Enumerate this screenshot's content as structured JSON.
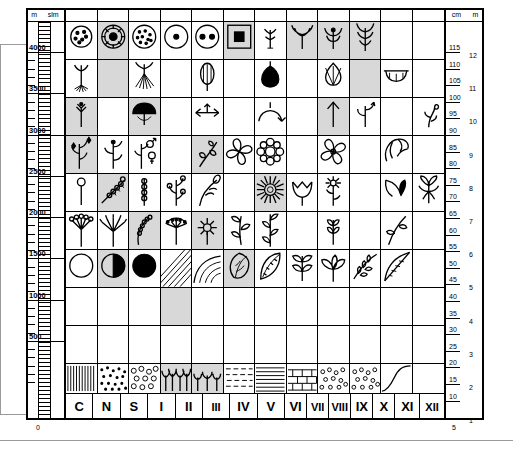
{
  "figure": {
    "type": "pollen-diagram-symbol-key",
    "left_axis": {
      "header_units": [
        "m",
        "slm"
      ],
      "labels": [
        "4000",
        "3500",
        "3000",
        "2500",
        "2000",
        "1500",
        "1000",
        "500",
        "0"
      ],
      "range": [
        0,
        4000
      ]
    },
    "right_axis": {
      "header_units": [
        "cm",
        "m"
      ],
      "cm_labels": [
        "115",
        "110",
        "105",
        "100",
        "95",
        "90",
        "85",
        "80",
        "75",
        "70",
        "65",
        "60",
        "55",
        "50",
        "45",
        "40",
        "35",
        "30",
        "25",
        "20",
        "15",
        "10"
      ],
      "m_labels": [
        "12",
        "11",
        "10",
        "9",
        "8",
        "7",
        "6",
        "5",
        "4",
        "3",
        "2",
        "1"
      ]
    },
    "columns": [
      "C",
      "N",
      "S",
      "I",
      "II",
      "III",
      "IV",
      "V",
      "VI",
      "VII",
      "VIII",
      "IX",
      "X",
      "XI",
      "XII"
    ],
    "column_labels_row": [
      "C",
      "N",
      "S",
      "I",
      "II",
      "III",
      "IV",
      "V",
      "VI",
      "VII",
      "VIII",
      "IX",
      "X",
      "XI",
      "XII"
    ],
    "rows": [
      {
        "row": 1,
        "symbols": [
          "pollen-grain-dotted",
          "pollen-grain-concentric-star",
          "pollen-grain-stippled",
          "pollen-grain-single-pore",
          "pollen-grain-two-pores",
          "square-in-square",
          "small-seedling",
          "grass-tuft",
          "plant-sprout-leaves",
          "tall-grass-plant"
        ]
      },
      {
        "row": 2,
        "symbols": [
          "rooted-seedling",
          "fibrous-root-plant",
          "seed-ovoid-striped",
          "bulb-dark",
          "seed-teardrop",
          "boat-shaped-vessel"
        ]
      },
      {
        "row": 3,
        "symbols": [
          "small-flower-stalk",
          "mushroom-cap",
          "double-arrow-spike",
          "curved-arrow-arc",
          "upward-arrow",
          "arrow-branching",
          "curled-tendril"
        ]
      },
      {
        "row": 4,
        "symbols": [
          "flowering-stem",
          "flowering-stem-2",
          "male-female-symbols-plant",
          "leafy-spiral-branch",
          "four-petal-flower",
          "ring-of-petals-flower",
          "broad-petal-flower",
          "curved-petal-flower"
        ]
      },
      {
        "row": 5,
        "symbols": [
          "pin-head-stem",
          "beaded-branch",
          "beaded-stem-vertical",
          "budding-branch",
          "curved-seed-stalk",
          "sunflower-composite",
          "tulip-flower",
          "small-daisy-plant",
          "curved-leaf-pair",
          "iris-flower"
        ]
      },
      {
        "row": 6,
        "symbols": [
          "umbel-multi-head",
          "umbel-spread",
          "catkin-coil",
          "umbel-flat-top",
          "small-composite-flower",
          "leafy-stem",
          "leafy-stem-tall",
          "small-branch-leaves",
          "long-leaf-stem"
        ]
      },
      {
        "row": 7,
        "symbols": [
          "circle-open",
          "circle-half-filled",
          "circle-filled",
          "hatched-square",
          "crescent-shading",
          "broad-leaf",
          "serrated-leaf",
          "compound-leaf",
          "palmate-leaf",
          "feathered-leaf",
          "pointed-leaf-hatched"
        ]
      },
      {
        "row": 8,
        "symbols": [
          "vertical-hatch-texture",
          "dotted-texture",
          "circles-texture",
          "small-plants-row",
          "seedlings-row",
          "dashes-texture",
          "horizontal-lines-texture",
          "brick-texture",
          "gravel-dots-texture",
          "rising-curve"
        ]
      }
    ]
  }
}
